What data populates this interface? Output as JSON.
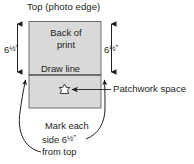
{
  "diagram": {
    "title": "Top (photo edge)",
    "photo_block": {
      "name": "photo-rectangle",
      "fill_color": "#d9d9d9",
      "border_color": "#6f6f6f",
      "upper_line_1": "Back of",
      "upper_line_2": "print",
      "draw_line_label": "Draw line",
      "lower_region_name": "patchwork-space-region"
    },
    "dimensions": {
      "left_label_number": "6",
      "left_label_fraction": "½",
      "left_label_unit": "”",
      "right_label_number": "6",
      "right_label_fraction": "½",
      "right_label_unit": "”"
    },
    "callout": {
      "label": "Patchwork space",
      "marker_icon": "star-icon"
    },
    "bottom_note": {
      "line1": "Mark each",
      "line2_prefix": "side 6",
      "line2_fraction": "½",
      "line2_unit": "”",
      "line3": "from top"
    },
    "colors": {
      "ink": "#231f20",
      "rule": "#6f6f6f",
      "panel": "#d9d9d9",
      "background": "#ffffff"
    }
  }
}
